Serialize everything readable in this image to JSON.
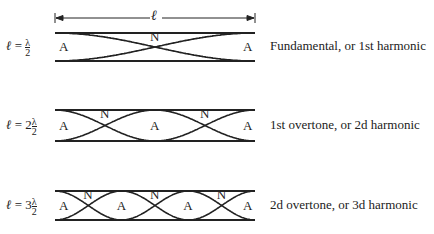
{
  "length_symbol": "ℓ",
  "rows": [
    {
      "equation": {
        "lhs": "ℓ",
        "eq": "=",
        "coef": "",
        "num": "λ",
        "den": "2"
      },
      "caption": "Fundamental, or 1st harmonic",
      "harmonic": 1,
      "node_labels": [
        "A",
        "N",
        "A"
      ]
    },
    {
      "equation": {
        "lhs": "ℓ",
        "eq": "=",
        "coef": "2",
        "num": "λ",
        "den": "2"
      },
      "caption": "1st overtone, or 2d harmonic",
      "harmonic": 2,
      "node_labels": [
        "A",
        "N",
        "A",
        "N",
        "A"
      ]
    },
    {
      "equation": {
        "lhs": "ℓ",
        "eq": "=",
        "coef": "3",
        "num": "λ",
        "den": "2"
      },
      "caption": "2d overtone, or 3d harmonic",
      "harmonic": 3,
      "node_labels": [
        "A",
        "N",
        "A",
        "N",
        "A",
        "N",
        "A"
      ]
    }
  ]
}
